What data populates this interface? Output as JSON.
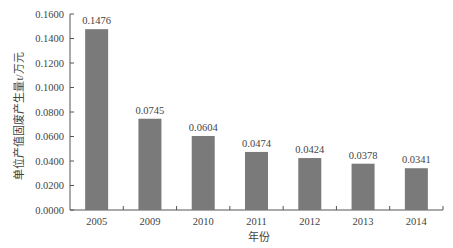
{
  "chart_data": {
    "type": "bar",
    "title": "",
    "xlabel": "年份",
    "ylabel": "单位产值固废产生量t/万元",
    "categories": [
      "2005",
      "2009",
      "2010",
      "2011",
      "2012",
      "2013",
      "2014"
    ],
    "values": [
      0.1476,
      0.0745,
      0.0604,
      0.0474,
      0.0424,
      0.0378,
      0.0341
    ],
    "value_labels": [
      "0.1476",
      "0.0745",
      "0.0604",
      "0.0474",
      "0.0424",
      "0.0378",
      "0.0341"
    ],
    "ylim": [
      0,
      0.16
    ],
    "yticks": [
      0,
      0.02,
      0.04,
      0.06,
      0.08,
      0.1,
      0.12,
      0.14,
      0.16
    ],
    "ytick_labels": [
      "0.0000",
      "0.0200",
      "0.0400",
      "0.0600",
      "0.0800",
      "0.1000",
      "0.1200",
      "0.1400",
      "0.1600"
    ],
    "grid": false,
    "legend": null,
    "bar_color": "#7a7a7a"
  }
}
